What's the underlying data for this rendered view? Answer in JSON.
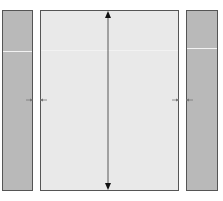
{
  "diagram": {
    "panels": [
      {
        "id": "left",
        "fill": "#b9b9b9",
        "x": 2,
        "y": 10,
        "w": 31,
        "h": 181,
        "divider_y": 40
      },
      {
        "id": "center",
        "fill": "#e9e9e9",
        "x": 40,
        "y": 10,
        "w": 139,
        "h": 181,
        "divider_y": 39
      },
      {
        "id": "right",
        "fill": "#b9b9b9",
        "x": 186,
        "y": 10,
        "w": 32,
        "h": 181,
        "divider_y": 37
      }
    ],
    "vertical_arrow": {
      "x": 108,
      "y1": 11,
      "y2": 190,
      "type": "double-headed",
      "color": "#222222"
    },
    "gap_arrows": [
      {
        "x1": 26,
        "x2": 47,
        "y": 100,
        "type": "double-headed",
        "color": "#777777"
      },
      {
        "x1": 172,
        "x2": 193,
        "y": 100,
        "type": "double-headed",
        "color": "#777777"
      }
    ],
    "colors": {
      "border": "#555555",
      "side_fill": "#b9b9b9",
      "center_fill": "#e9e9e9"
    }
  }
}
